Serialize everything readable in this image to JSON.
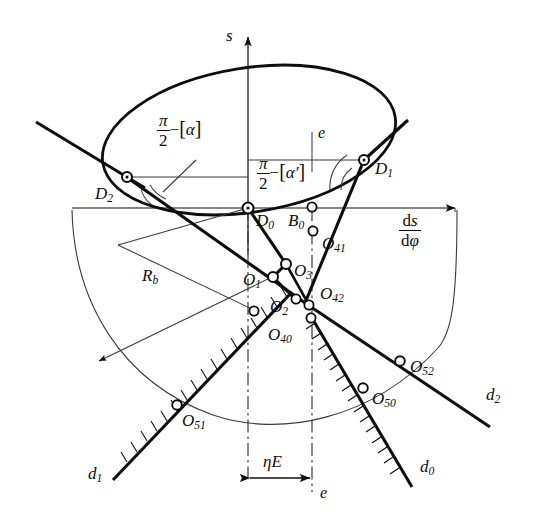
{
  "figure": {
    "kind": "kinematic-cam-geometry-diagram",
    "axes": {
      "vertical_label": "s",
      "horizontal_label_numerator": "ds",
      "horizontal_label_denominator": "dφ",
      "vertical_axis_name": "s-axis",
      "horizontal_axis_name": "ds/dφ-axis"
    },
    "angle_labels": [
      {
        "id": "alpha",
        "numerator": "π",
        "denominator": "2",
        "minus": "−",
        "bracket_open": "[",
        "symbol": "α",
        "bracket_close": "]",
        "full": "π/2 − [α]"
      },
      {
        "id": "alpha-prime",
        "numerator": "π",
        "denominator": "2",
        "minus": "−",
        "bracket_open": "[",
        "symbol": "α′",
        "bracket_close": "]",
        "full": "π/2 − [α′]"
      }
    ],
    "points": [
      {
        "id": "D1",
        "base": "D",
        "sub": "1",
        "x": 364,
        "y": 160
      },
      {
        "id": "D2",
        "base": "D",
        "sub": "2",
        "x": 127,
        "y": 177
      },
      {
        "id": "D0",
        "base": "D",
        "sub": "0",
        "x": 248,
        "y": 208
      },
      {
        "id": "B0",
        "base": "B",
        "sub": "0",
        "x": 312,
        "y": 208
      },
      {
        "id": "O41",
        "base": "O",
        "sub": "41",
        "x": 313,
        "y": 231
      },
      {
        "id": "O3",
        "base": "O",
        "sub": "3",
        "x": 285,
        "y": 264
      },
      {
        "id": "O1",
        "base": "O",
        "sub": "1",
        "x": 274,
        "y": 277
      },
      {
        "id": "O2",
        "base": "O",
        "sub": "2",
        "x": 296,
        "y": 300
      },
      {
        "id": "O42",
        "base": "O",
        "sub": "42",
        "x": 309,
        "y": 305
      },
      {
        "id": "O40",
        "base": "O",
        "sub": "40",
        "x": 311,
        "y": 318
      },
      {
        "id": "O51",
        "base": "O",
        "sub": "51",
        "x": 177,
        "y": 405
      },
      {
        "id": "O50",
        "base": "O",
        "sub": "50",
        "x": 363,
        "y": 388
      },
      {
        "id": "O52",
        "base": "O",
        "sub": "52",
        "x": 400,
        "y": 361
      }
    ],
    "point_labels": [
      {
        "for": "D1",
        "text": "D",
        "sub": "1"
      },
      {
        "for": "D2",
        "text": "D",
        "sub": "2"
      },
      {
        "for": "D0",
        "text": "D",
        "sub": "0"
      },
      {
        "for": "B0",
        "text": "B",
        "sub": "0"
      },
      {
        "for": "O41",
        "text": "O",
        "sub": "41"
      },
      {
        "for": "O3",
        "text": "O",
        "sub": "3"
      },
      {
        "for": "O1",
        "text": "O",
        "sub": "1"
      },
      {
        "for": "O2",
        "text": "O",
        "sub": "2"
      },
      {
        "for": "O42",
        "text": "O",
        "sub": "42"
      },
      {
        "for": "O40",
        "text": "O",
        "sub": "40"
      },
      {
        "for": "O51",
        "text": "O",
        "sub": "51"
      },
      {
        "for": "O50",
        "text": "O",
        "sub": "50"
      },
      {
        "for": "O52",
        "text": "O",
        "sub": "52"
      }
    ],
    "line_labels": [
      {
        "id": "d0",
        "text": "d",
        "sub": "0"
      },
      {
        "id": "d1",
        "text": "d",
        "sub": "1"
      },
      {
        "id": "d2",
        "text": "d",
        "sub": "2"
      }
    ],
    "radius_label": {
      "text": "R",
      "sub": "b"
    },
    "dimension": {
      "label": "ηE",
      "eta": "η",
      "E": "E"
    },
    "eccentricity_labels": [
      {
        "id": "e-top",
        "text": "e"
      },
      {
        "id": "e-bottom",
        "text": "e"
      }
    ],
    "colors": {
      "stroke": "#0d0d0d",
      "thin": "#333333",
      "background": "#ffffff"
    }
  }
}
